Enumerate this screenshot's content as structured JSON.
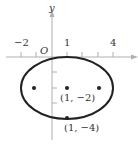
{
  "diagram": {
    "type": "ellipse-graph",
    "axes": {
      "x_label": "x",
      "y_label": "y",
      "origin_label": "O",
      "x_tick_labels": [
        {
          "value": -2,
          "text": "−2"
        },
        {
          "value": 1,
          "text": "1"
        },
        {
          "value": 4,
          "text": "4"
        }
      ]
    },
    "ellipse": {
      "center": [
        1,
        -2
      ],
      "semi_major_x": 3,
      "semi_minor_y": 2
    },
    "points": [
      {
        "coords": [
          1,
          -2
        ],
        "label": "(1, −2)"
      },
      {
        "coords": [
          1,
          -4
        ],
        "label": "(1, −4)"
      },
      {
        "coords": [
          -1.24,
          -2
        ],
        "label": ""
      },
      {
        "coords": [
          3.24,
          -2
        ],
        "label": ""
      }
    ],
    "colors": {
      "axis": "#b0b0b0",
      "curve": "#222222",
      "text": "#333333"
    }
  }
}
